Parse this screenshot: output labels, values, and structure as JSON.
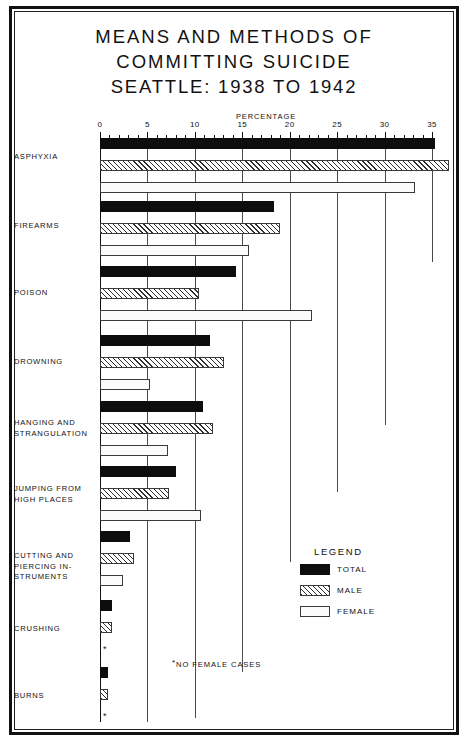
{
  "title": {
    "line1": "MEANS AND METHODS OF",
    "line2": "COMMITTING SUICIDE",
    "line3": "SEATTLE: 1938 TO 1942"
  },
  "legend": {
    "title": "LEGEND",
    "items": [
      {
        "key": "total",
        "label": "TOTAL",
        "color": "#0d0d0d",
        "pattern": "solid"
      },
      {
        "key": "male",
        "label": "MALE",
        "color": "#2e2e2e",
        "pattern": "diagonal-hatch"
      },
      {
        "key": "female",
        "label": "FEMALE",
        "color": "#ffffff",
        "pattern": "open"
      }
    ]
  },
  "footnote": {
    "symbol": "*",
    "text": "NO FEMALE CASES"
  },
  "no_data_marker": "*",
  "chart_data": {
    "type": "bar",
    "orientation": "horizontal",
    "title": "MEANS AND METHODS OF COMMITTING SUICIDE SEATTLE: 1938 TO 1942",
    "xlabel": "PERCENTAGE",
    "ylabel": "",
    "xlim": [
      0,
      35
    ],
    "xticks": [
      0,
      5,
      10,
      15,
      20,
      25,
      30,
      35
    ],
    "xticklabels": [
      "0",
      "5",
      "10",
      "15",
      "20",
      "25",
      "30",
      "35"
    ],
    "minor_tick_interval": 1,
    "grid": "vertical-staircase",
    "legend_position": "lower-right",
    "categories": [
      "ASPHYXIA",
      "FIREARMS",
      "POISON",
      "DROWNING",
      "HANGING AND STRANGULATION",
      "JUMPING FROM HIGH PLACES",
      "CUTTING AND PIERCING INSTRUMENTS",
      "CRUSHING",
      "BURNS"
    ],
    "category_labels": [
      [
        "ASPHYXIA"
      ],
      [
        "FIREARMS"
      ],
      [
        "POISON"
      ],
      [
        "DROWNING"
      ],
      [
        "HANGING AND",
        "STRANGULATION"
      ],
      [
        "JUMPING FROM",
        "HIGH PLACES"
      ],
      [
        "CUTTING AND",
        "PIERCING IN-",
        "STRUMENTS"
      ],
      [
        "CRUSHING"
      ],
      [
        "BURNS"
      ]
    ],
    "series": [
      {
        "name": "TOTAL",
        "values": [
          35.3,
          18.3,
          14.3,
          11.6,
          10.9,
          8.0,
          3.2,
          1.3,
          0.8
        ]
      },
      {
        "name": "MALE",
        "values": [
          36.8,
          19.0,
          10.4,
          13.1,
          11.9,
          7.3,
          3.6,
          1.3,
          0.8
        ]
      },
      {
        "name": "FEMALE",
        "values": [
          33.2,
          15.7,
          22.3,
          5.3,
          7.2,
          10.6,
          2.4,
          null,
          null
        ]
      }
    ]
  }
}
